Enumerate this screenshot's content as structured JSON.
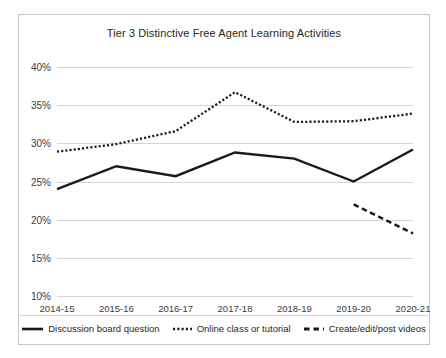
{
  "chart_data": {
    "type": "line",
    "title": "Tier 3 Distinctive Free Agent Learning Activities",
    "xlabel": "",
    "ylabel": "",
    "categories": [
      "2014-15",
      "2015-16",
      "2016-17",
      "2017-18",
      "2018-19",
      "2019-20",
      "2020-21"
    ],
    "ylim": [
      10,
      40
    ],
    "ytick_labels": [
      "40%",
      "35%",
      "30%",
      "25%",
      "20%",
      "15%",
      "10%"
    ],
    "ytick_values": [
      40,
      35,
      30,
      25,
      20,
      15,
      10
    ],
    "grid": "horizontal",
    "legend_position": "bottom",
    "series": [
      {
        "name": "Discussion board question",
        "style": "solid",
        "color": "#1a1a1a",
        "values": [
          24.0,
          27.0,
          25.7,
          28.8,
          28.0,
          25.0,
          29.2
        ]
      },
      {
        "name": "Online class or tutorial",
        "style": "dotted",
        "color": "#1a1a1a",
        "values": [
          28.9,
          29.9,
          31.6,
          36.7,
          32.8,
          32.9,
          33.9
        ]
      },
      {
        "name": "Create/edit/post videos",
        "style": "dashed",
        "color": "#1a1a1a",
        "values": [
          null,
          null,
          null,
          null,
          null,
          22.0,
          18.2
        ]
      }
    ]
  },
  "colors": {
    "series_line": "#1a1a1a",
    "gridline": "#d5d5d5",
    "frame_border": "#c9c9c9",
    "background": "#ffffff",
    "text": "#262626"
  }
}
